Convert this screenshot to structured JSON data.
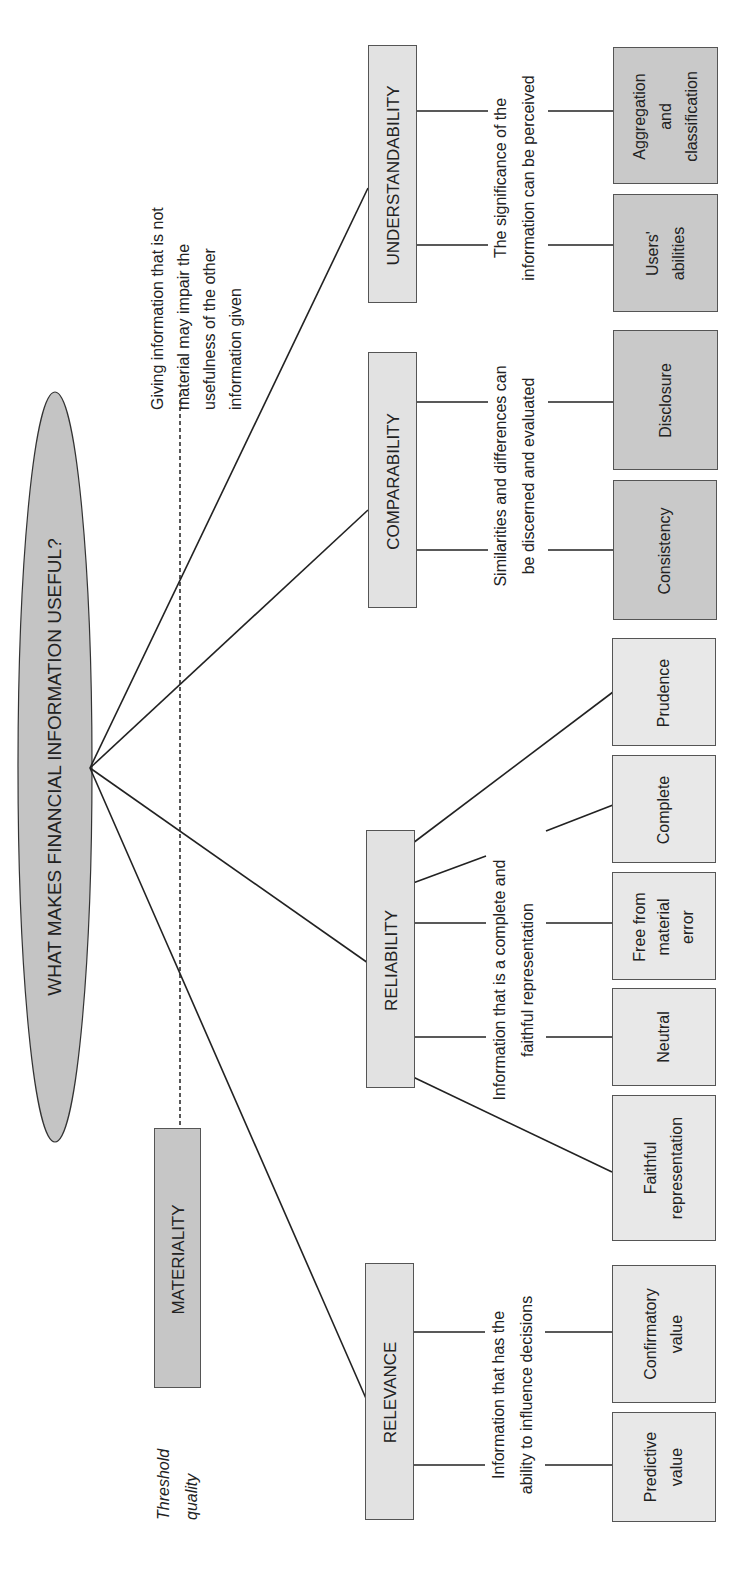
{
  "title": "WHAT MAKES FINANCIAL INFORMATION USEFUL?",
  "threshold": {
    "label": "Threshold\nquality",
    "box_label": "MATERIALITY",
    "note": "Giving information that is not\nmaterial may impair the\nusefulness of the other\ninformation given"
  },
  "qualities": [
    {
      "name": "UNDERSTANDABILITY",
      "description": "The significance of the\ninformation can be perceived",
      "children": [
        "Aggregation\nand\nclassification",
        "Users'\nabilities"
      ]
    },
    {
      "name": "COMPARABILITY",
      "description": "Similarities and differences can\nbe discerned and evaluated",
      "children": [
        "Disclosure",
        "Consistency"
      ]
    },
    {
      "name": "RELIABILITY",
      "description": "Information that is a complete and\nfaithful representation",
      "children": [
        "Prudence",
        "Complete",
        "Free from\nmaterial\nerror",
        "Neutral",
        "Faithful\nrepresentation"
      ]
    },
    {
      "name": "RELEVANCE",
      "description": "Information that has the\nability to influence decisions",
      "children": [
        "Confirmatory\nvalue",
        "Predictive\nvalue"
      ]
    }
  ],
  "colors": {
    "ellipse_fill": "#c4c4c4",
    "primary_box_fill": "#e2e2e2",
    "materiality_fill": "#c6c6c6",
    "dark_child_fill": "#cdcdcd",
    "light_child_fill": "#e8e8e8",
    "line": "#222222"
  }
}
